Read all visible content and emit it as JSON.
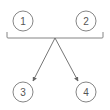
{
  "diagram": {
    "nodes": [
      {
        "id": "1",
        "label": "1",
        "cx": 23,
        "cy": 21
      },
      {
        "id": "2",
        "label": "2",
        "cx": 86,
        "cy": 21
      },
      {
        "id": "3",
        "label": "3",
        "cx": 23,
        "cy": 92
      },
      {
        "id": "4",
        "label": "4",
        "cx": 86,
        "cy": 92
      }
    ],
    "grouping": {
      "type": "bracket",
      "groups": [
        "1",
        "2"
      ]
    },
    "edges": [
      {
        "from": "group-1-2",
        "to": "3"
      },
      {
        "from": "group-1-2",
        "to": "4"
      }
    ],
    "colors": {
      "stroke": "#666666",
      "text": "#555555",
      "background": "#ffffff"
    }
  }
}
